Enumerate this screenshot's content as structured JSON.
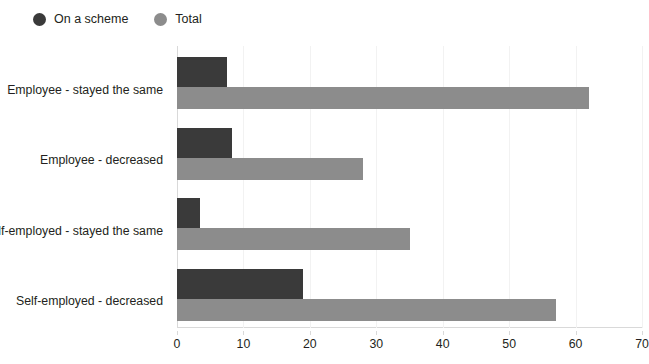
{
  "chart_data": {
    "type": "bar",
    "orientation": "horizontal",
    "title": "",
    "xlabel": "",
    "ylabel": "",
    "xlim": [
      0,
      70
    ],
    "xticks": [
      0,
      10,
      20,
      30,
      40,
      50,
      60,
      70
    ],
    "grid": true,
    "legend_position": "top-left",
    "categories": [
      "Employee - stayed the same",
      "Employee - decreased",
      "Self-employed - stayed the same",
      "Self-employed - decreased"
    ],
    "series": [
      {
        "name": "On a scheme",
        "color": "#3a3a3a",
        "values": [
          7.5,
          8.3,
          3.4,
          19
        ]
      },
      {
        "name": "Total",
        "color": "#8c8c8c",
        "values": [
          62,
          28,
          35,
          57
        ]
      }
    ]
  },
  "legend": {
    "items": [
      {
        "label": "On a scheme",
        "color": "#3a3a3a"
      },
      {
        "label": "Total",
        "color": "#8c8c8c"
      }
    ]
  },
  "axis": {
    "x_tick_labels": [
      "0",
      "10",
      "20",
      "30",
      "40",
      "50",
      "60",
      "70"
    ]
  }
}
